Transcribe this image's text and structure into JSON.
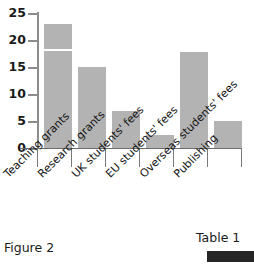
{
  "figure": {
    "caption": "Figure 2"
  },
  "table_ref": {
    "caption": "Table 1"
  },
  "chart_data": {
    "type": "bar",
    "title": "",
    "xlabel": "",
    "ylabel": "",
    "ylim": [
      0,
      25
    ],
    "yticks": [
      0,
      5,
      10,
      15,
      20,
      25
    ],
    "ytick_labels": [
      "0",
      "5",
      "10",
      "15",
      "20",
      "25"
    ],
    "grid": false,
    "legend": "none",
    "bar_color": "#b3b3b3",
    "categories": [
      "Teaching grants",
      "Research grants",
      "UK students' fees",
      "EU students' fees",
      "Overseas students' fees",
      "Publishing"
    ],
    "values": [
      23,
      15,
      6.8,
      2.5,
      17.7,
      5
    ],
    "annotations": [
      {
        "type": "internal-divider-line",
        "category": "Teaching grants",
        "value": 18,
        "color": "#ffffff"
      }
    ]
  }
}
